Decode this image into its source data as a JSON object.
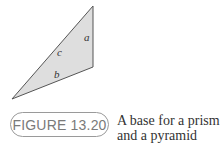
{
  "figure": {
    "label": "FIGURE 13.20",
    "caption_line1": "A base for a prism",
    "caption_line2": "and a pyramid"
  },
  "triangle": {
    "side_labels": {
      "a": "a",
      "b": "b",
      "c": "c"
    },
    "fill_color": "#dcdcdc",
    "stroke_color": "#555555"
  }
}
